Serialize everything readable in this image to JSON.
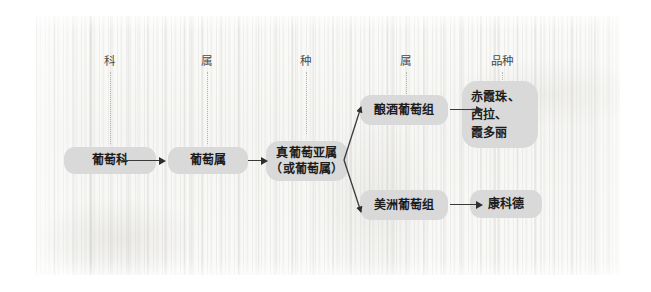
{
  "figure": {
    "background": "wood-texture",
    "box_color": "#d9d9d9",
    "text_color": "#1c1c1c",
    "arrow_color": "#2e2e2e",
    "guide_color": "#b9b6b0"
  },
  "columns": [
    {
      "id": "family",
      "label": "科"
    },
    {
      "id": "genus",
      "label": "属"
    },
    {
      "id": "species",
      "label": "种"
    },
    {
      "id": "section",
      "label": "属"
    },
    {
      "id": "variety",
      "label": "品种"
    }
  ],
  "nodes": {
    "family": {
      "label": "葡萄科"
    },
    "genus": {
      "label": "葡萄属"
    },
    "subgenus": {
      "line1": "真葡萄亚属",
      "line2": "（或葡萄属）"
    },
    "wine_group": {
      "label": "酿酒葡萄组"
    },
    "american_group": {
      "label": "美洲葡萄组"
    },
    "varieties": {
      "line1": "赤霞珠、",
      "line2": "西拉、",
      "line3": "霞多丽"
    },
    "concord": {
      "label": "康科德"
    }
  },
  "connections": [
    {
      "from": "family",
      "to": "genus",
      "type": "straight"
    },
    {
      "from": "genus",
      "to": "subgenus",
      "type": "straight"
    },
    {
      "from": "subgenus",
      "to": "wine_group",
      "type": "diagonal-up"
    },
    {
      "from": "subgenus",
      "to": "american_group",
      "type": "diagonal-down"
    },
    {
      "from": "wine_group",
      "to": "varieties",
      "type": "straight"
    },
    {
      "from": "american_group",
      "to": "concord",
      "type": "straight"
    }
  ]
}
